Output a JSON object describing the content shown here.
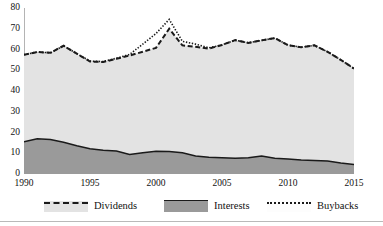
{
  "chart_data": {
    "type": "area",
    "title": "",
    "subtitle": "",
    "xlabel": "",
    "ylabel": "",
    "xlim": [
      1990,
      2015
    ],
    "ylim": [
      0,
      80
    ],
    "grid": false,
    "legend_position": "bottom",
    "x": [
      1990,
      1991,
      1992,
      1993,
      1994,
      1995,
      1996,
      1997,
      1998,
      1999,
      2000,
      2001,
      2002,
      2003,
      2004,
      2005,
      2006,
      2007,
      2008,
      2009,
      2010,
      2011,
      2012,
      2013,
      2014,
      2015
    ],
    "xticks": [
      1990,
      1995,
      2000,
      2005,
      2010,
      2015
    ],
    "xtick_labels": [
      "1990",
      "1995",
      "2000",
      "2005",
      "2010",
      "2015"
    ],
    "yticks": [
      0,
      10,
      20,
      30,
      40,
      50,
      60,
      70,
      80
    ],
    "ytick_labels": [
      "0",
      "10",
      "20",
      "30",
      "40",
      "50",
      "60",
      "70",
      "80"
    ],
    "series": [
      {
        "name": "Interests",
        "role": "lower-band",
        "style": "solid-line-filled",
        "fill": "#9a9a9a",
        "line": "#1a1a1a",
        "values": [
          15.5,
          17.0,
          16.6,
          15.3,
          13.6,
          12.2,
          11.4,
          11.1,
          9.4,
          10.2,
          11.0,
          10.9,
          10.2,
          8.7,
          8.1,
          7.8,
          7.6,
          7.8,
          8.7,
          7.6,
          7.2,
          6.7,
          6.5,
          6.3,
          5.3,
          4.6
        ]
      },
      {
        "name": "Dividends",
        "role": "upper-band-total",
        "style": "dashed-line-filled",
        "fill": "#e3e3e3",
        "line": "#1a1a1a",
        "values": [
          57.5,
          58.8,
          58.4,
          61.8,
          58.0,
          54.2,
          54.0,
          55.5,
          57.1,
          58.9,
          60.8,
          70.0,
          62.0,
          61.3,
          60.4,
          62.2,
          64.5,
          63.2,
          64.4,
          65.5,
          62.1,
          61.1,
          62.0,
          58.9,
          55.0,
          50.8
        ]
      },
      {
        "name": "Buybacks",
        "role": "overlay-line",
        "style": "dotted-line",
        "line": "#1a1a1a",
        "values": [
          57.5,
          58.8,
          58.4,
          61.8,
          58.0,
          54.4,
          54.2,
          55.8,
          57.6,
          62.6,
          67.7,
          74.5,
          63.9,
          62.6,
          60.8,
          62.2,
          64.5,
          63.2,
          64.4,
          65.5,
          62.1,
          61.1,
          62.0,
          58.9,
          55.0,
          50.8
        ]
      }
    ]
  },
  "legend": {
    "items": [
      {
        "label": "Dividends",
        "swatch": "dividends-swatch"
      },
      {
        "label": "Interests",
        "swatch": "interests-swatch"
      },
      {
        "label": "Buybacks",
        "swatch": "buybacks-swatch"
      }
    ]
  },
  "colors": {
    "dividends_fill": "#e3e3e3",
    "interests_fill": "#9a9a9a",
    "line": "#1a1a1a",
    "axis": "#6b6b6b",
    "background": "#ffffff"
  }
}
